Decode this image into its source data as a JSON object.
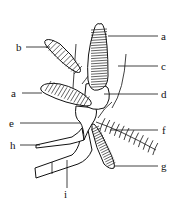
{
  "figure": {
    "type": "biological-diagram",
    "labels": [
      {
        "id": "a_top",
        "text": "a"
      },
      {
        "id": "b",
        "text": "b"
      },
      {
        "id": "c",
        "text": "c"
      },
      {
        "id": "a_mid",
        "text": "a"
      },
      {
        "id": "d",
        "text": "d"
      },
      {
        "id": "e",
        "text": "e"
      },
      {
        "id": "f",
        "text": "f"
      },
      {
        "id": "h",
        "text": "h"
      },
      {
        "id": "g",
        "text": "g"
      },
      {
        "id": "i",
        "text": "i"
      }
    ]
  }
}
